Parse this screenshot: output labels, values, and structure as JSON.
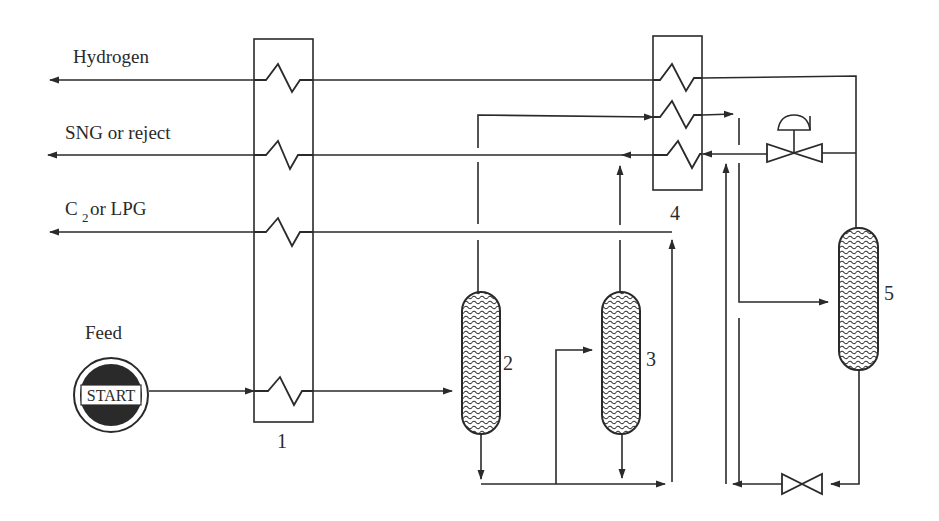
{
  "diagram": {
    "type": "process-flow-diagram",
    "streams": {
      "hydrogen": "Hydrogen",
      "sng": "SNG or reject",
      "c2_prefix": "C",
      "c2_sub": "2",
      "c2_suffix": "or LPG",
      "feed": "Feed"
    },
    "start_label": "START",
    "units": {
      "exchanger_1": "1",
      "vessel_2": "2",
      "vessel_3": "3",
      "exchanger_4": "4",
      "vessel_5": "5"
    },
    "colors": {
      "line": "#2a2a2a",
      "background": "#ffffff",
      "start_fill": "#2a2a2a"
    }
  }
}
